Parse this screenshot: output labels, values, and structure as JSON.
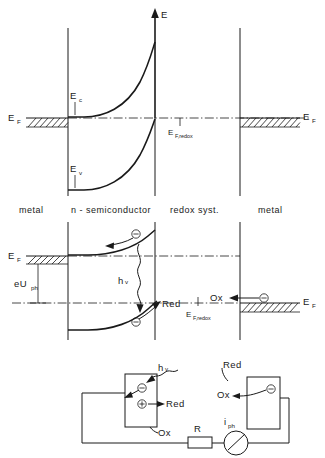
{
  "figure": {
    "kind": "band-energy-diagram",
    "axis": {
      "energy_label": "E"
    },
    "regions": [
      {
        "id": "metal-left",
        "label": "metal"
      },
      {
        "id": "semiconductor",
        "label": "n - semiconductor"
      },
      {
        "id": "redox",
        "label": "redox syst."
      },
      {
        "id": "metal-right",
        "label": "metal"
      }
    ],
    "panel_equilibrium": {
      "labels": {
        "fermi_left": {
          "base": "E",
          "sub": "F"
        },
        "fermi_right": {
          "base": "E",
          "sub": "F"
        },
        "conduction": {
          "base": "E",
          "sub": "c"
        },
        "valence": {
          "base": "E",
          "sub": "v"
        },
        "fermi_redox": {
          "base": "E",
          "sub": "F,redox"
        }
      }
    },
    "panel_illuminated": {
      "labels": {
        "fermi_left": {
          "base": "E",
          "sub": "F"
        },
        "fermi_right": {
          "base": "E",
          "sub": "F"
        },
        "fermi_redox": {
          "base": "E",
          "sub": "F,redox"
        },
        "photovoltage": {
          "base": "eU",
          "sub": "ph"
        },
        "photon": {
          "base": "h",
          "sub": "v"
        },
        "reduced": "Red",
        "oxidized": "Ox"
      },
      "carriers": [
        {
          "id": "electron-conduction",
          "glyph": "−"
        },
        {
          "id": "electron-valence",
          "glyph": "−"
        },
        {
          "id": "electron-metal",
          "glyph": "−"
        }
      ]
    },
    "panel_circuit": {
      "labels": {
        "photon": {
          "base": "h",
          "sub": "v"
        },
        "reduced_left": "Red",
        "oxidized_left": "Ox",
        "reduced_right": "Red",
        "oxidized_right": "Ox",
        "resistor": "R",
        "current": {
          "base": "i",
          "sub": "ph"
        }
      },
      "carriers": [
        {
          "id": "photoelectrode-electron",
          "glyph": "−"
        },
        {
          "id": "photoelectrode-hole",
          "glyph": "+"
        },
        {
          "id": "counter-electrode-electron",
          "glyph": "−"
        }
      ]
    }
  },
  "colors": {
    "ink": "#1a1a1a",
    "background": "#ffffff"
  }
}
